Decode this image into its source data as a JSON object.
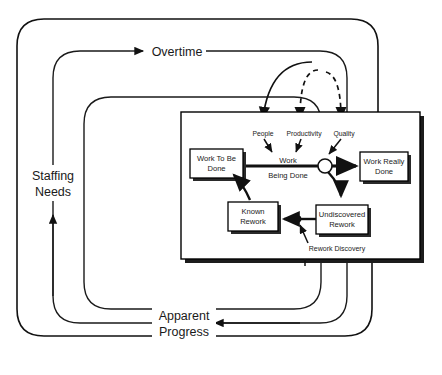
{
  "diagram": {
    "type": "system-dynamics-causal-loop",
    "background_color": "#ffffff",
    "line_color": "#111111"
  },
  "outer_labels": {
    "overtime": "Overtime",
    "staffing_needs_line1": "Staffing",
    "staffing_needs_line2": "Needs",
    "apparent_progress_line1": "Apparent",
    "apparent_progress_line2": "Progress"
  },
  "drivers": [
    {
      "label": "People",
      "style": "solid"
    },
    {
      "label": "Productivity",
      "style": "dashed"
    },
    {
      "label": "Quality",
      "style": "dashed"
    }
  ],
  "nodes": [
    {
      "id": "work-to-be-done",
      "line1": "Work To Be",
      "line2": "Done"
    },
    {
      "id": "work-really-done",
      "line1": "Work Really",
      "line2": "Done"
    },
    {
      "id": "known-rework",
      "line1": "Known",
      "line2": "Rework"
    },
    {
      "id": "undiscovered-rework",
      "line1": "Undiscovered",
      "line2": "Rework"
    }
  ],
  "flow_labels": {
    "work_being_done_line1": "Work",
    "work_being_done_line2": "Being Done",
    "rework_discovery": "Rework Discovery"
  }
}
